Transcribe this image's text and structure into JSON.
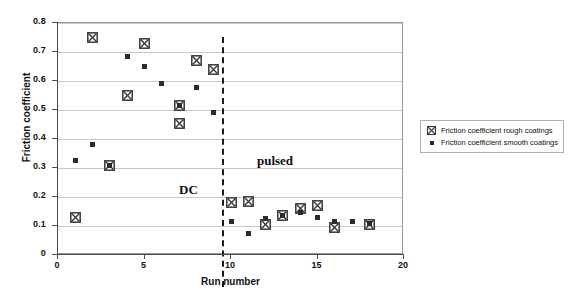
{
  "chart_data": {
    "type": "scatter",
    "title": "",
    "xlabel": "Run number",
    "ylabel": "Friction coefficient",
    "xlim": [
      0,
      20
    ],
    "ylim": [
      0,
      0.8
    ],
    "xticks": [
      "0",
      "5",
      "10",
      "15",
      "20"
    ],
    "xtick_values": [
      0,
      5,
      10,
      15,
      20
    ],
    "yticks": [
      "0",
      "0.1",
      "0.2",
      "0.3",
      "0.4",
      "0.5",
      "0.6",
      "0.7",
      "0.8"
    ],
    "ytick_values": [
      0,
      0.1,
      0.2,
      0.3,
      0.4,
      0.5,
      0.6,
      0.7,
      0.8
    ],
    "grid": "horizontal",
    "legend_position": "right",
    "series": [
      {
        "name": "Friction coefficient rough coatings",
        "marker": "crossed-square",
        "color": "#3a3a3a",
        "points": [
          {
            "x": 1,
            "y": 0.13
          },
          {
            "x": 2,
            "y": 0.75
          },
          {
            "x": 3,
            "y": 0.31
          },
          {
            "x": 4,
            "y": 0.55
          },
          {
            "x": 5,
            "y": 0.73
          },
          {
            "x": 7,
            "y": 0.455
          },
          {
            "x": 7,
            "y": 0.515
          },
          {
            "x": 8,
            "y": 0.67
          },
          {
            "x": 9,
            "y": 0.64
          },
          {
            "x": 10,
            "y": 0.18
          },
          {
            "x": 11,
            "y": 0.185
          },
          {
            "x": 12,
            "y": 0.105
          },
          {
            "x": 13,
            "y": 0.135
          },
          {
            "x": 14,
            "y": 0.16
          },
          {
            "x": 15,
            "y": 0.17
          },
          {
            "x": 16,
            "y": 0.095
          },
          {
            "x": 18,
            "y": 0.105
          }
        ]
      },
      {
        "name": "Friction coefficient smooth coatings",
        "marker": "filled-square",
        "color": "#2b2b2b",
        "points": [
          {
            "x": 1,
            "y": 0.325
          },
          {
            "x": 2,
            "y": 0.38
          },
          {
            "x": 3,
            "y": 0.31
          },
          {
            "x": 4,
            "y": 0.685
          },
          {
            "x": 5,
            "y": 0.65
          },
          {
            "x": 6,
            "y": 0.59
          },
          {
            "x": 7,
            "y": 0.515
          },
          {
            "x": 8,
            "y": 0.578
          },
          {
            "x": 9,
            "y": 0.492
          },
          {
            "x": 10,
            "y": 0.115
          },
          {
            "x": 11,
            "y": 0.075
          },
          {
            "x": 12,
            "y": 0.125
          },
          {
            "x": 13,
            "y": 0.135
          },
          {
            "x": 14,
            "y": 0.145
          },
          {
            "x": 15,
            "y": 0.13
          },
          {
            "x": 16,
            "y": 0.115
          },
          {
            "x": 17,
            "y": 0.115
          },
          {
            "x": 18,
            "y": 0.108
          }
        ]
      }
    ],
    "annotations": [
      {
        "text": "DC",
        "x": 7.0,
        "y": 0.225
      },
      {
        "text": "pulsed",
        "x": 11.5,
        "y": 0.325
      }
    ],
    "divider": {
      "x": 9.5,
      "style": "dashed"
    }
  },
  "legend": {
    "entries": [
      {
        "label": "Friction coefficient rough coatings",
        "marker": "crossed-square-icon"
      },
      {
        "label": "Friction coefficient smooth coatings",
        "marker": "filled-square-icon"
      }
    ]
  }
}
